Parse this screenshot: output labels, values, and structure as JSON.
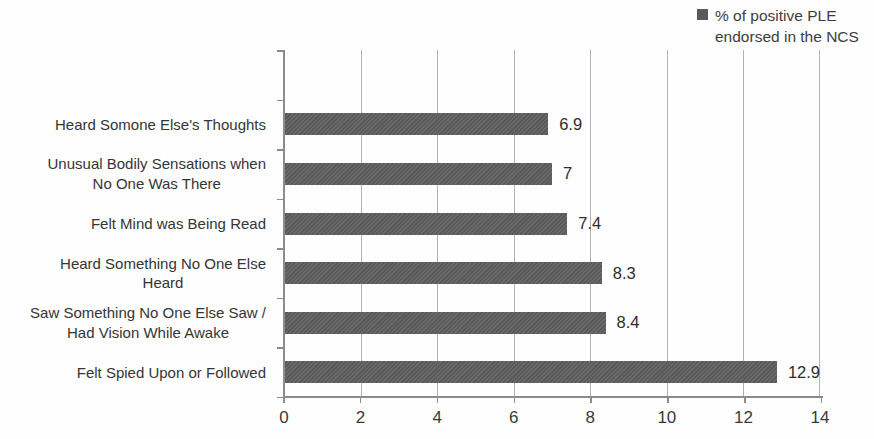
{
  "legend": {
    "label": "% of positive PLE\nendorsed in the NCS",
    "marker_color": "#595959"
  },
  "chart_data": {
    "type": "bar",
    "orientation": "horizontal",
    "series_name": "% of positive PLE endorsed in the NCS",
    "categories": [
      "Heard Somone Else's Thoughts",
      "Unusual Bodily Sensations when\nNo One Was  There",
      "Felt Mind was Being Read",
      "Heard Something No One Else\nHeard",
      "Saw Something No One Else Saw /\nHad Vision While Awake",
      "Felt Spied Upon or Followed"
    ],
    "values": [
      6.9,
      7,
      7.4,
      8.3,
      8.4,
      12.9
    ],
    "value_labels": [
      "6.9",
      "7",
      "7.4",
      "8.3",
      "8.4",
      "12.9"
    ],
    "xlim": [
      0,
      14
    ],
    "x_ticks": [
      "0",
      "2",
      "4",
      "6",
      "8",
      "10",
      "12",
      "14"
    ],
    "grid": "vertical",
    "legend_position": "top-right",
    "bar_color": "#5e5e5e",
    "gridline_color": "#b2b2b2",
    "axis_color": "#8c8c8c"
  }
}
